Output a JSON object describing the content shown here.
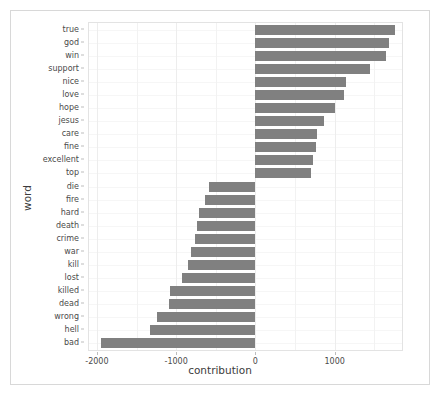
{
  "chart_data": {
    "type": "bar",
    "orientation": "horizontal",
    "title": "",
    "xlabel": "contribution",
    "ylabel": "word",
    "xlim": [
      -2100,
      1850
    ],
    "xticks": [
      -2000,
      -1000,
      0,
      1000
    ],
    "xticklabels": [
      "-2000",
      "-1000",
      "0",
      "1000"
    ],
    "grid": true,
    "legend": null,
    "bar_color": "#808080",
    "panel_background": "#ffffff",
    "categories": [
      "true",
      "god",
      "win",
      "support",
      "nice",
      "love",
      "hope",
      "jesus",
      "care",
      "fine",
      "excellent",
      "top",
      "die",
      "fire",
      "hard",
      "death",
      "crime",
      "war",
      "kill",
      "lost",
      "killed",
      "dead",
      "wrong",
      "hell",
      "bad"
    ],
    "values": [
      1765,
      1686,
      1647,
      1450,
      1140,
      1120,
      1010,
      860,
      780,
      760,
      725,
      705,
      -588,
      -641,
      -706,
      -732,
      -758,
      -810,
      -850,
      -928,
      -1072,
      -1085,
      -1242,
      -1333,
      -1950
    ]
  }
}
